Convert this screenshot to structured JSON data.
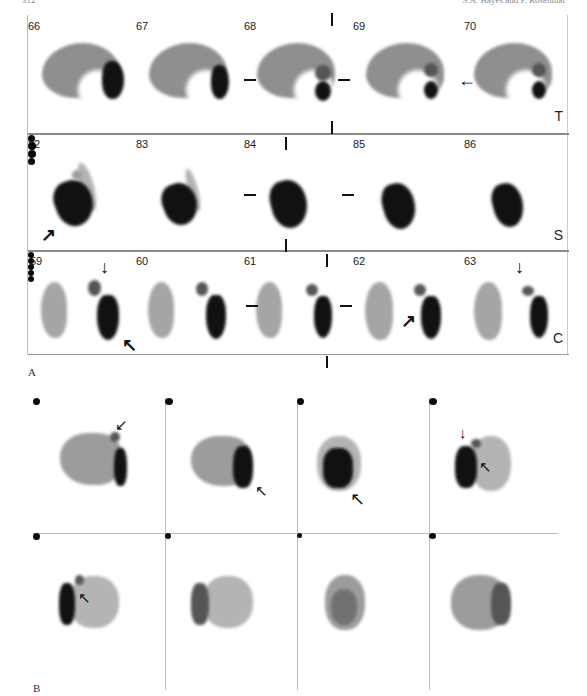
{
  "page": {
    "running_head_left": "312",
    "running_head_right": "S.A. Hayes and P. Rosenthal"
  },
  "figure": {
    "panel_a": {
      "label": "A",
      "rows": [
        {
          "plane": "T",
          "slices": [
            "66",
            "67",
            "68",
            "69",
            "70"
          ]
        },
        {
          "plane": "S",
          "slices": [
            "82",
            "83",
            "84",
            "85",
            "86"
          ]
        },
        {
          "plane": "C",
          "slices": [
            "59",
            "60",
            "61",
            "62",
            "63"
          ]
        }
      ],
      "arrow_glyphs": {
        "left": "←",
        "up_right": "↗",
        "down": "↓",
        "up_left": "↖"
      }
    },
    "panel_b": {
      "label": "B",
      "grid": {
        "columns": 4,
        "rows": 2
      },
      "arrow_glyphs": {
        "down_left": "↙",
        "up_left": "↖",
        "down": "↓"
      }
    }
  }
}
